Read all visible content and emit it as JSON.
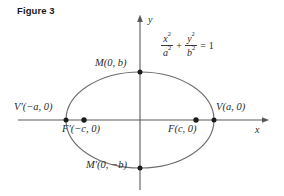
{
  "figure": {
    "title": "Figure 3",
    "caption_position": "top-left"
  },
  "equation": {
    "num1": "x",
    "num1_exp": "2",
    "den1": "a",
    "den1_exp": "2",
    "plus": "+",
    "num2": "y",
    "num2_exp": "2",
    "den2": "b",
    "den2_exp": "2",
    "equals": "=",
    "rhs": "1",
    "plain": "x^2/a^2 + y^2/b^2 = 1"
  },
  "axes": {
    "x_label": "x",
    "y_label": "y",
    "x_axis_name": "horizontal-axis",
    "y_axis_name": "vertical-axis",
    "origin": "(0, 0)"
  },
  "points": {
    "vertex_right": "V(a, 0)",
    "vertex_left": "V′(−a, 0)",
    "covertex_top": "M(0, b)",
    "covertex_bottom": "M′(0, −b)",
    "focus_right": "F(c, 0)",
    "focus_left": "F′(−c, 0)"
  },
  "colors": {
    "curve": "#6e6e6e",
    "axis": "#5a5a5a",
    "text": "#2a2a2a",
    "title": "#1a1a1a",
    "marker": "#1c1c1c",
    "background": "#ffffff"
  },
  "geometry": {
    "center_x": 140,
    "center_y": 120,
    "semi_major_a": 74,
    "semi_minor_b": 48,
    "focal_distance_c": 56
  }
}
